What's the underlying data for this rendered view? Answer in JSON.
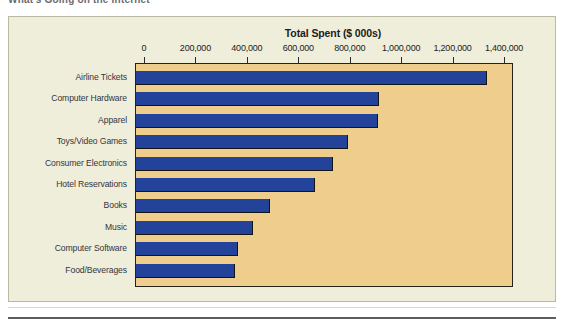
{
  "page": {
    "clipped_heading": "What's Going on the Internet"
  },
  "chart_data": {
    "type": "bar",
    "orientation": "horizontal",
    "title": "Total Spent ($ 000s)",
    "xlabel": "",
    "ylabel": "",
    "xlim": [
      0,
      1400000
    ],
    "grid": false,
    "legend": null,
    "x_tick_labels": [
      "0",
      "200,000",
      "400,000",
      "600,000",
      "800,000",
      "1,000,000",
      "1,200,000",
      "1,400,000"
    ],
    "x_tick_values": [
      0,
      200000,
      400000,
      600000,
      800000,
      1000000,
      1200000,
      1400000
    ],
    "categories": [
      "Airline Tickets",
      "Computer Hardware",
      "Apparel",
      "Toys/Video Games",
      "Consumer Electronics",
      "Hotel Reservations",
      "Books",
      "Music",
      "Computer Software",
      "Food/Beverages"
    ],
    "values": [
      1330000,
      910000,
      905000,
      790000,
      730000,
      660000,
      485000,
      420000,
      360000,
      350000
    ],
    "colors": {
      "bar": "#23439a",
      "plot_background": "#efcd8c",
      "panel_background": "#eeeeda",
      "axis_line": "#23231c",
      "label_text": "#35353d",
      "title_text": "#1c1c1c"
    }
  }
}
